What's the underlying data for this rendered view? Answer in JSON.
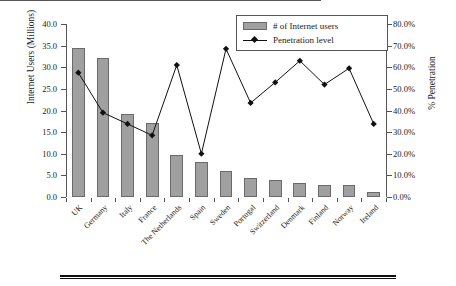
{
  "chart_data": {
    "type": "bar",
    "title": "",
    "xlabel": "",
    "ylabel": "Internet Users (Millions)",
    "y2label": "% Penetration",
    "ylim": [
      0,
      40
    ],
    "y2lim": [
      0,
      80
    ],
    "grid": false,
    "legend_position": "top-right",
    "categories": [
      "UK",
      "Germany",
      "Italy",
      "France",
      "The Netherlands",
      "Spain",
      "Sweden",
      "Portugal",
      "Switzerland",
      "Denmark",
      "Finland",
      "Norway",
      "Ireland"
    ],
    "left_ticks": [
      "40.0",
      "35.0",
      "30.0",
      "25.0",
      "20.0",
      "15.0",
      "10.0",
      "5.0",
      "0.0"
    ],
    "left_tick_values": [
      40,
      35,
      30,
      25,
      20,
      15,
      10,
      5,
      0
    ],
    "right_ticks": [
      "80.0%",
      "70.0%",
      "60.0%",
      "50.0%",
      "40.0%",
      "30.0%",
      "20.0%",
      "10.0%",
      "0.0%"
    ],
    "right_tick_values": [
      80,
      70,
      60,
      50,
      40,
      30,
      20,
      10,
      0
    ],
    "series": [
      {
        "name": "# of Internet users",
        "type": "bar",
        "axis": "left",
        "color": "#a0a0a0",
        "values": [
          34.5,
          32.1,
          19.2,
          17.0,
          9.8,
          8.1,
          6.1,
          4.5,
          3.9,
          3.3,
          2.8,
          2.7,
          1.2
        ]
      },
      {
        "name": "Penetration level",
        "type": "line",
        "axis": "right",
        "color": "#111111",
        "values": [
          57.5,
          39.0,
          33.8,
          28.5,
          61.0,
          20.0,
          68.5,
          43.5,
          53.0,
          63.0,
          52.0,
          59.5,
          33.8
        ]
      }
    ]
  },
  "legend": {
    "items": [
      {
        "label": "# of Internet users",
        "marker": "bar-swatch"
      },
      {
        "label": "Penetration level",
        "marker": "line-diamond-swatch"
      }
    ]
  }
}
